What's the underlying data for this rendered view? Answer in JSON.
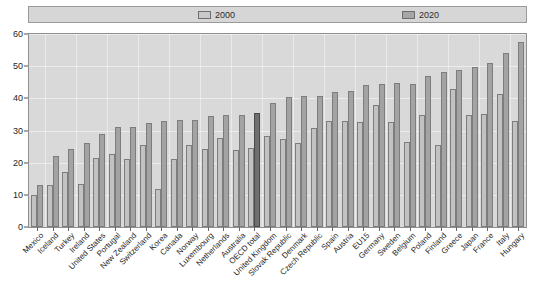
{
  "chart_data": {
    "type": "bar",
    "title": "",
    "subtitle": "",
    "xlabel": "",
    "ylabel": "",
    "ylim": [
      0,
      60
    ],
    "yticks": [
      0,
      10,
      20,
      30,
      40,
      50,
      60
    ],
    "grid": true,
    "legend_position": "top",
    "highlight_category": "OECD total",
    "categories": [
      "Mexico",
      "Iceland",
      "Turkey",
      "Ireland",
      "United States",
      "Portugal",
      "New Zealand",
      "Switzerland",
      "Korea",
      "Canada",
      "Norway",
      "Luxembourg",
      "Netherlands",
      "Australia",
      "OECD total",
      "United Kingdom",
      "Slovak Republic",
      "Denmark",
      "Czech Republic",
      "Spain",
      "Austria",
      "EU15",
      "Germany",
      "Sweden",
      "Belgium",
      "Poland",
      "Finland",
      "Greece",
      "Japan",
      "France",
      "Italy",
      "Hungary"
    ],
    "series": [
      {
        "name": "2000",
        "color": "#c2c2c2",
        "values": [
          9.8,
          13.0,
          17.0,
          13.4,
          21.5,
          22.6,
          21.1,
          25.4,
          11.9,
          21.0,
          25.4,
          24.2,
          27.6,
          24.0,
          24.6,
          28.2,
          27.5,
          26.0,
          30.9,
          32.9,
          33.0,
          32.5,
          37.8,
          32.7,
          26.3,
          34.8,
          25.6,
          43.0,
          34.8,
          35.0,
          41.2,
          33.0
        ]
      },
      {
        "name": "2020",
        "color": "#a3a3a3",
        "values": [
          13.0,
          22.0,
          24.2,
          26.1,
          28.9,
          31.0,
          31.2,
          32.4,
          33.0,
          33.3,
          33.4,
          34.4,
          34.9,
          34.8,
          35.5,
          38.5,
          40.3,
          40.6,
          40.7,
          41.9,
          42.3,
          44.3,
          44.6,
          44.7,
          44.6,
          46.9,
          48.3,
          48.9,
          49.8,
          51.0,
          54.0,
          57.5
        ]
      }
    ]
  },
  "legend": {
    "entries": [
      {
        "label": "2000",
        "icon": "legend-swatch-2000"
      },
      {
        "label": "2020",
        "icon": "legend-swatch-2020"
      }
    ]
  },
  "axes": {
    "y": {
      "labels": [
        "60",
        "50",
        "40",
        "30",
        "20",
        "10",
        "0"
      ]
    }
  },
  "colors": {
    "plot_background": "#d9d9d9",
    "legend_background": "#d6d6d6",
    "series_2000": "#c2c2c2",
    "series_2020": "#a3a3a3",
    "highlight": "#6f6f6f",
    "gridline": "#ececec",
    "frame": "#8f8f8f",
    "text": "#1e1e1e"
  }
}
